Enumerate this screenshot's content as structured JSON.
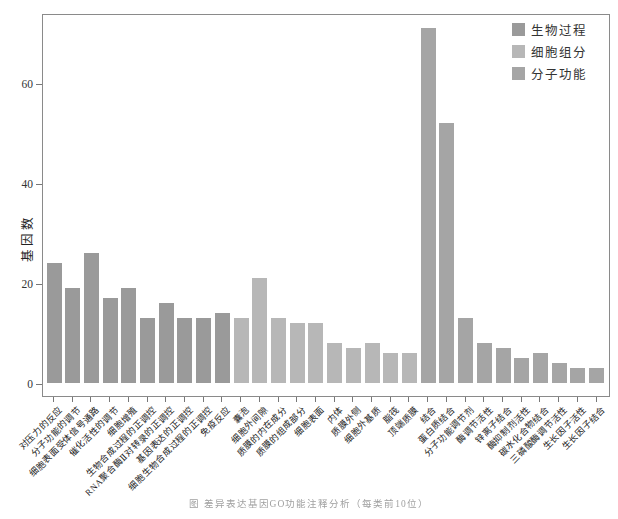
{
  "figure": {
    "ylabel": "基因数",
    "caption": "图 差异表达基因GO功能注释分析（每类前10位）"
  },
  "legend": {
    "position": "top-right",
    "items": [
      {
        "label": "生物过程",
        "color": "#9a9a9a",
        "group": "bp"
      },
      {
        "label": "细胞组分",
        "color": "#b7b7b7",
        "group": "cc"
      },
      {
        "label": "分子功能",
        "color": "#a5a5a5",
        "group": "mf"
      }
    ]
  },
  "chart_data": {
    "type": "bar",
    "title": "",
    "xlabel": "",
    "ylabel": "基因数",
    "ylim": [
      0,
      74
    ],
    "yticks": [
      0,
      20,
      40,
      60
    ],
    "grid": false,
    "legend_position": "top-right",
    "groups": {
      "bp": "生物过程",
      "cc": "细胞组分",
      "mf": "分子功能"
    },
    "group_colors": {
      "bp": "#9a9a9a",
      "cc": "#b7b7b7",
      "mf": "#a5a5a5"
    },
    "categories": [
      "对压力的反应",
      "分子功能的调节",
      "细胞表面受体信号通路",
      "催化活性的调节",
      "细胞增殖",
      "生物合成过程的正调控",
      "RNA聚合酶Ⅱ对转录的正调控",
      "基因表达的正调控",
      "细胞生物合成过程的正调控",
      "免疫反应",
      "囊泡",
      "细胞外间隙",
      "质膜的内在成分",
      "质膜的组成部分",
      "细胞表面",
      "内体",
      "质膜外侧",
      "细胞外基质",
      "脂筏",
      "顶端质膜",
      "结合",
      "蛋白质结合",
      "分子功能调节剂",
      "酶调节活性",
      "锌离子结合",
      "酶抑制剂活性",
      "碳水化合物结合",
      "三磷酸酶调节活性",
      "生长因子活性",
      "生长因子结合"
    ],
    "values": [
      24,
      19,
      26,
      17,
      19,
      13,
      16,
      13,
      13,
      14,
      13,
      21,
      13,
      12,
      12,
      8,
      7,
      8,
      6,
      6,
      71,
      52,
      13,
      8,
      7,
      5,
      6,
      4,
      3,
      3
    ],
    "bar_groups": [
      "bp",
      "bp",
      "bp",
      "bp",
      "bp",
      "bp",
      "bp",
      "bp",
      "bp",
      "bp",
      "cc",
      "cc",
      "cc",
      "cc",
      "cc",
      "cc",
      "cc",
      "cc",
      "cc",
      "cc",
      "mf",
      "mf",
      "mf",
      "mf",
      "mf",
      "mf",
      "mf",
      "mf",
      "mf",
      "mf"
    ]
  }
}
